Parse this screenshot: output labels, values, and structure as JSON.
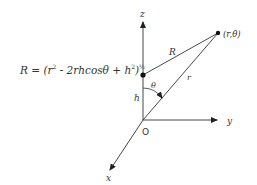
{
  "formula": {
    "lhs": "R",
    "eq": " = (r",
    "sq1": "2",
    "mid": " - 2rhcosθ + h",
    "sq2": "2",
    "close": ")",
    "exp": "½"
  },
  "labels": {
    "z_axis": "z",
    "y_axis": "y",
    "x_axis": "x",
    "origin": "O",
    "point": "(r,θ)",
    "R": "R",
    "r": "r",
    "h": "h",
    "theta": "θ"
  },
  "geometry": {
    "origin": [
      143,
      120
    ],
    "charge_point": [
      143,
      75
    ],
    "field_point": [
      218,
      33
    ],
    "z_tip": [
      143,
      20
    ],
    "y_tip": [
      218,
      120
    ],
    "x_tip": [
      108,
      172
    ]
  }
}
